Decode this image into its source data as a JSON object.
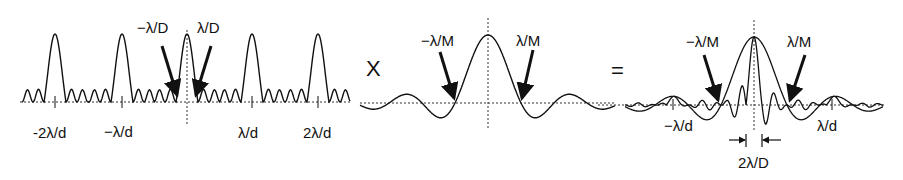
{
  "figure": {
    "panels": [
      {
        "id": "grating",
        "description": "Diffraction pattern of periodic grating (comb of narrow peaks)",
        "labels": {
          "minus_lambda_D": "−λ/D",
          "lambda_D": "λ/D",
          "minus_2lambda_d": "-2λ/d",
          "minus_lambda_d": "−λ/d",
          "lambda_d": "λ/d",
          "two_lambda_d": "2λ/d"
        }
      },
      {
        "id": "envelope",
        "description": "Single-aperture envelope (broad sinc)",
        "labels": {
          "minus_lambda_M": "−λ/M",
          "lambda_M": "λ/M"
        }
      },
      {
        "id": "product",
        "description": "Product: comb modulated by envelope",
        "labels": {
          "minus_lambda_M": "−λ/M",
          "lambda_M": "λ/M",
          "minus_lambda_d": "−λ/d",
          "lambda_d": "λ/d",
          "width": "2λ/D"
        }
      }
    ],
    "operators": {
      "times": "X",
      "equals": "="
    },
    "colors": {
      "ink": "#111111",
      "background": "#ffffff"
    }
  }
}
